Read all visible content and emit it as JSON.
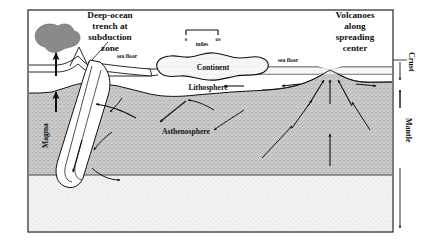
{
  "diagram": {
    "title_alt": "Plate tectonics cross-section",
    "labels": {
      "trench": [
        "Deep-ocean",
        "trench at",
        "subduction",
        "zone"
      ],
      "volcanoes": [
        "Volcanoes",
        "along",
        "spreading",
        "center"
      ],
      "continent": "Continent",
      "lithosphere": "Lithosphere",
      "asthenosphere": "Asthenosphere",
      "magma": "Magma",
      "sea_floor_left": "sea floor",
      "sea_floor_right": "sea floor",
      "crust": "Crust",
      "mantle": "Mantle"
    },
    "scale_bar": {
      "min": "0",
      "max": "60",
      "units": "miles"
    },
    "colors": {
      "ink": "#111111",
      "asthenosphere_fill": "#cfcfcf",
      "lower_mantle_fill": "#f0f0f0",
      "magma_blob_fill": "#8a8a8a",
      "frame": "#222222",
      "background": "#ffffff"
    }
  }
}
